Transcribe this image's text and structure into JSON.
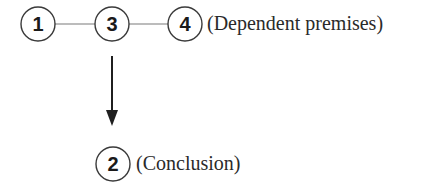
{
  "diagram": {
    "type": "argument-map",
    "nodes": [
      {
        "id": "1",
        "label": "1",
        "cx": 38,
        "cy": 24,
        "r": 17
      },
      {
        "id": "3",
        "label": "3",
        "cx": 112,
        "cy": 24,
        "r": 17
      },
      {
        "id": "4",
        "label": "4",
        "cx": 185,
        "cy": 24,
        "r": 17
      },
      {
        "id": "2",
        "label": "2",
        "cx": 113,
        "cy": 164,
        "r": 17
      }
    ],
    "links": [
      {
        "from": "1",
        "to": "3",
        "kind": "joined-premise-line"
      },
      {
        "from": "3",
        "to": "4",
        "kind": "joined-premise-line"
      }
    ],
    "arrows": [
      {
        "from": "premise-group",
        "to": "2",
        "kind": "inference"
      }
    ],
    "annotations": {
      "premises": "(Dependent premises)",
      "conclusion": "(Conclusion)"
    },
    "colors": {
      "stroke": "#333333",
      "link": "#777777",
      "text": "#1a1a1a",
      "background": "#ffffff"
    }
  }
}
